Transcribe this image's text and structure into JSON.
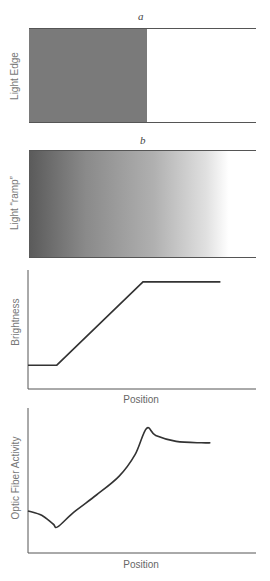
{
  "panel_a": {
    "letter": "a",
    "ylabel": "Light Edge",
    "dark_color": "#7a7a7a",
    "edge_position": 0.52
  },
  "panel_b": {
    "letter": "b",
    "ylabel": "Light “ramp”"
  },
  "chart_data": [
    {
      "type": "line",
      "title": "",
      "xlabel": "Position",
      "ylabel": "Brightness",
      "grid": false,
      "xlim": [
        0,
        1
      ],
      "ylim": [
        0,
        1
      ],
      "series": [
        {
          "name": "brightness",
          "x": [
            0,
            0.13,
            0.52,
            0.87
          ],
          "y": [
            0.2,
            0.2,
            0.9,
            0.9
          ]
        }
      ]
    },
    {
      "type": "line",
      "title": "",
      "xlabel": "Position",
      "ylabel": "Optic Fiber Activity",
      "grid": false,
      "xlim": [
        0,
        1
      ],
      "ylim": [
        0,
        1
      ],
      "series": [
        {
          "name": "optic-fiber-activity",
          "x": [
            0,
            0.06,
            0.11,
            0.13,
            0.2,
            0.3,
            0.4,
            0.47,
            0.52,
            0.56,
            0.65,
            0.76,
            0.8
          ],
          "y": [
            0.29,
            0.26,
            0.2,
            0.18,
            0.28,
            0.4,
            0.53,
            0.68,
            0.86,
            0.81,
            0.77,
            0.76,
            0.76
          ]
        }
      ]
    }
  ]
}
